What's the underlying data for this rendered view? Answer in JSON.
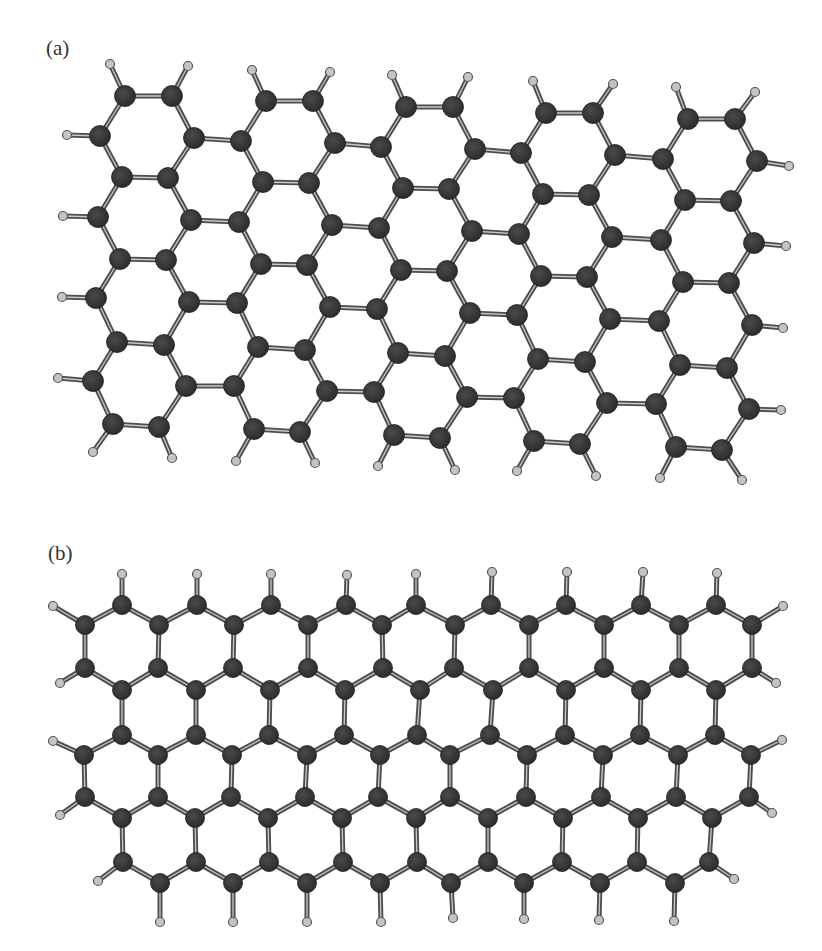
{
  "figure": {
    "panels": [
      {
        "id": "a",
        "label": "(a)",
        "description": "armchair-edged hydrogen-passivated graphene nanoribbon",
        "bond_threshold": 60,
        "carbon_radius": 10.5,
        "column_template": [
          [
            125,
            96
          ],
          [
            172,
            96
          ],
          [
            100,
            136
          ],
          [
            194,
            138
          ],
          [
            122,
            177
          ],
          [
            168,
            178
          ],
          [
            98,
            217
          ],
          [
            191,
            220
          ],
          [
            120,
            259
          ],
          [
            166,
            260
          ],
          [
            96,
            298
          ],
          [
            189,
            302
          ],
          [
            117,
            342
          ],
          [
            164,
            345
          ],
          [
            93,
            381
          ],
          [
            186,
            386
          ],
          [
            113,
            424
          ],
          [
            159,
            427
          ]
        ],
        "column_offsets": [
          [
            0,
            0
          ],
          [
            141,
            5
          ],
          [
            281,
            11
          ],
          [
            421,
            17
          ],
          [
            563,
            23
          ]
        ],
        "hydrogens": [
          [
            110,
            64
          ],
          [
            188,
            66
          ],
          [
            252,
            70
          ],
          [
            330,
            72
          ],
          [
            392,
            75
          ],
          [
            468,
            77
          ],
          [
            533,
            81
          ],
          [
            613,
            84
          ],
          [
            676,
            87
          ],
          [
            755,
            92
          ],
          [
            67,
            135
          ],
          [
            63,
            216
          ],
          [
            62,
            297
          ],
          [
            58,
            378
          ],
          [
            789,
            166
          ],
          [
            786,
            246
          ],
          [
            783,
            328
          ],
          [
            781,
            410
          ],
          [
            93,
            452
          ],
          [
            172,
            458
          ],
          [
            236,
            461
          ],
          [
            315,
            463
          ],
          [
            378,
            466
          ],
          [
            455,
            470
          ],
          [
            517,
            471
          ],
          [
            596,
            476
          ],
          [
            660,
            478
          ],
          [
            742,
            480
          ]
        ]
      },
      {
        "id": "b",
        "label": "(b)",
        "description": "zigzag-edged hydrogen-passivated graphene nanoribbon with 5-7 defect",
        "bond_threshold": 58,
        "carbon_radius": 9.5,
        "rows": [
          {
            "y": 605,
            "x": [
              122,
              197,
              271,
              346,
              416,
              491,
              566,
              641,
              716
            ]
          },
          {
            "y": 625,
            "x": [
              85,
              159,
              234,
              308,
              382,
              455,
              529,
              604,
              679,
              752
            ]
          },
          {
            "y": 668,
            "x": [
              85,
              158,
              233,
              308,
              383,
              454,
              529,
              604,
              679,
              752
            ]
          },
          {
            "y": 690,
            "x": [
              122,
              196,
              270,
              345,
              420,
              493,
              566,
              641,
              716
            ]
          },
          {
            "y": 735,
            "x": [
              122,
              196,
              269,
              344,
              417,
              490,
              565,
              640,
              715
            ]
          },
          {
            "y": 755,
            "x": [
              84,
              158,
              232,
              307,
              380,
              450,
              527,
              603,
              678,
              751
            ]
          },
          {
            "y": 797,
            "x": [
              85,
              158,
              231,
              305,
              378,
              450,
              526,
              601,
              676,
              749
            ]
          },
          {
            "y": 818,
            "x": [
              122,
              195,
              268,
              342,
              416,
              488,
              563,
              638,
              712
            ]
          },
          {
            "y": 862,
            "x": [
              123,
              196,
              269,
              343,
              417,
              488,
              562,
              637,
              709
            ]
          },
          {
            "y": 883,
            "x": [
              160,
              233,
              307,
              380,
              451,
              524,
              600,
              675
            ]
          }
        ],
        "hydrogens": [
          [
            122,
            574
          ],
          [
            197,
            574
          ],
          [
            271,
            574
          ],
          [
            347,
            575
          ],
          [
            416,
            574
          ],
          [
            492,
            572
          ],
          [
            567,
            572
          ],
          [
            643,
            572
          ],
          [
            717,
            573
          ],
          [
            53,
            606
          ],
          [
            60,
            683
          ],
          [
            53,
            741
          ],
          [
            60,
            815
          ],
          [
            98,
            881
          ],
          [
            783,
            606
          ],
          [
            776,
            683
          ],
          [
            782,
            740
          ],
          [
            772,
            813
          ],
          [
            734,
            879
          ],
          [
            160,
            922
          ],
          [
            233,
            922
          ],
          [
            307,
            922
          ],
          [
            381,
            922
          ],
          [
            453,
            918
          ],
          [
            524,
            919
          ],
          [
            599,
            920
          ],
          [
            674,
            921
          ]
        ]
      }
    ],
    "style": {
      "carbon_color": "#2b2b2b",
      "carbon_highlight": "#4a4a4a",
      "bond_outer_color": "#4d4d4d",
      "bond_inner_color": "#c8c8c8",
      "hydrogen_fill": "#c4c4c4",
      "hydrogen_stroke": "#555555",
      "hydrogen_radius": 4.5,
      "background": "#ffffff"
    }
  }
}
